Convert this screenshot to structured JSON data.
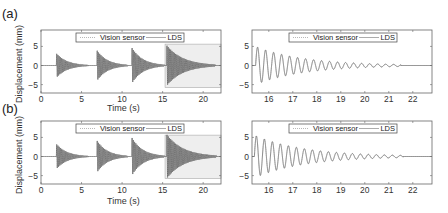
{
  "figure": {
    "panels": [
      {
        "label": "(a)"
      },
      {
        "label": "(b)"
      }
    ],
    "ylabel": "Displacement (mm)",
    "xlabel": "Time (s)"
  },
  "legend": {
    "items": [
      "Vision sensor",
      "LDS"
    ]
  },
  "colors": {
    "signal": "#555555",
    "axis": "#666666",
    "highlight": "#eeeeee",
    "legend_border": "#444444"
  },
  "chart_data": [
    {
      "id": "a-left",
      "type": "line",
      "title": "",
      "xlabel": "Time (s)",
      "ylabel": "Displacement (mm)",
      "xlim": [
        0,
        22.2
      ],
      "ylim": [
        -7.2,
        9.3
      ],
      "xticks": [
        0,
        5,
        10,
        15,
        20
      ],
      "yticks": [
        -5,
        0,
        5
      ],
      "legend": [
        "Vision sensor",
        "LDS"
      ],
      "highlight_region": [
        15.3,
        22.2
      ],
      "bursts": [
        {
          "start": 1.9,
          "end": 5.8,
          "amp": 3.2
        },
        {
          "start": 6.9,
          "end": 10.7,
          "amp": 4.0
        },
        {
          "start": 11.2,
          "end": 15.2,
          "amp": 4.7
        },
        {
          "start": 15.5,
          "end": 21.5,
          "amp": 5.3
        }
      ],
      "freq_hz": 3.0
    },
    {
      "id": "a-right",
      "type": "line",
      "title": "",
      "xlabel": "",
      "ylabel": "",
      "xlim": [
        15.3,
        22.8
      ],
      "ylim": [
        -7.2,
        9.3
      ],
      "xticks": [
        16,
        17,
        18,
        19,
        20,
        21,
        22
      ],
      "yticks": [
        -5,
        0,
        5
      ],
      "legend": [
        "Vision sensor",
        "LDS"
      ],
      "bursts": [
        {
          "start": 15.45,
          "end": 21.5,
          "amp": 5.0
        }
      ],
      "freq_hz": 3.0
    },
    {
      "id": "b-left",
      "type": "line",
      "title": "",
      "xlabel": "Time (s)",
      "ylabel": "Displacement (mm)",
      "xlim": [
        0,
        22.2
      ],
      "ylim": [
        -7.2,
        9.3
      ],
      "xticks": [
        0,
        5,
        10,
        15,
        20
      ],
      "yticks": [
        -5,
        0,
        5
      ],
      "legend": [
        "Vision sensor",
        "LDS"
      ],
      "highlight_region": [
        15.3,
        22.2
      ],
      "bursts": [
        {
          "start": 1.9,
          "end": 5.8,
          "amp": 3.3
        },
        {
          "start": 6.9,
          "end": 10.7,
          "amp": 4.2
        },
        {
          "start": 11.2,
          "end": 15.2,
          "amp": 5.0
        },
        {
          "start": 15.5,
          "end": 21.6,
          "amp": 5.8
        }
      ],
      "freq_hz": 3.0
    },
    {
      "id": "b-right",
      "type": "line",
      "title": "",
      "xlabel": "",
      "ylabel": "",
      "xlim": [
        15.3,
        22.8
      ],
      "ylim": [
        -7.2,
        9.3
      ],
      "xticks": [
        16,
        17,
        18,
        19,
        20,
        21,
        22
      ],
      "yticks": [
        -5,
        0,
        5
      ],
      "legend": [
        "Vision sensor",
        "LDS"
      ],
      "bursts": [
        {
          "start": 15.4,
          "end": 21.6,
          "amp": 5.6
        }
      ],
      "freq_hz": 3.0
    }
  ]
}
